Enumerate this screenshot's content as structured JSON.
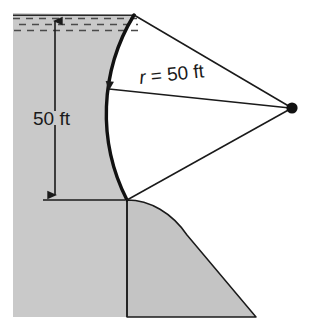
{
  "figure": {
    "labels": {
      "depth": "50 ft",
      "radius_var": "r",
      "radius_eq": " = 50 ft"
    },
    "colors": {
      "fill_gray": "#c9c9c9",
      "fill_gray_lower": "#c4c4c4",
      "outline": "#1a1a1a",
      "water_dash": "#4a4a4a",
      "background": "#ffffff"
    },
    "geometry": {
      "depth_value": 50,
      "depth_units": "ft",
      "radius_value": 50,
      "radius_units": "ft",
      "center_point": {
        "x": 292,
        "y": 108
      },
      "arc_top": {
        "x": 134,
        "y": 15
      },
      "arc_bottom": {
        "x": 127,
        "y": 200
      },
      "arc_leftmost": {
        "x": 103,
        "y": 108
      },
      "water_surface_y": 16,
      "base_line_y": 200
    },
    "elements": {
      "water_region": "water-hatching",
      "left_soil": "soil-mass-left",
      "lower_soil": "soil-mass-lower",
      "curved_face": "curved-dam-face",
      "center_dot": "arc-center-point",
      "upper_radius_line": "radius-line-upper",
      "lower_radius_line": "radius-line-lower",
      "dimension_line": "depth-dimension-line"
    }
  }
}
